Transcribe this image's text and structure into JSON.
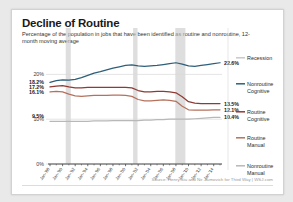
{
  "title": "Decline of Routine",
  "subtitle": "Percentage of the population in jobs that have been identified as routine and nonroutine, 12-month moving average",
  "source": "Source: Henry Siu and Nir Jaimovich for Third Way  |  WSJ.com",
  "colors": {
    "nonroutine_cognitive": "#2e5f7a",
    "routine_cognitive": "#8e3b34",
    "routine_manual": "#b5715c",
    "nonroutine_manual": "#b8b8b8",
    "recession": "#c9c9c9",
    "grid": "#d8d8d8",
    "axis": "#4a4a4a"
  },
  "legend": {
    "items": [
      {
        "label_line1": "Recession",
        "label_line2": "",
        "color": "#c9c9c9"
      },
      {
        "label_line1": "Nonroutine",
        "label_line2": "Cognitive",
        "color": "#2e5f7a"
      },
      {
        "label_line1": "Routine",
        "label_line2": "Cognitive",
        "color": "#8e3b34"
      },
      {
        "label_line1": "Routine",
        "label_line2": "Manual",
        "color": "#b5715c"
      },
      {
        "label_line1": "Nonroutine",
        "label_line2": "Manual",
        "color": "#b8b8b8"
      }
    ]
  },
  "chart_data": {
    "type": "line",
    "title": "Decline of Routine",
    "subtitle": "Percentage of the population in jobs that have been identified as routine and nonroutine, 12-month moving average",
    "xlabel": "",
    "ylabel": "",
    "ylim": [
      0,
      25
    ],
    "yticks": [
      0,
      10,
      20
    ],
    "ytick_labels": [
      "0%",
      "10%",
      "20%"
    ],
    "grid": true,
    "legend_position": "right",
    "x_tick_labels": [
      "Jan-'88",
      "Jan-'90",
      "Jan-'92",
      "Jan-'94",
      "Jan-'96",
      "Jan-'98",
      "Jan-'00",
      "Jan-'02",
      "Jan-'04",
      "Jan-'06",
      "Jan-'08",
      "Jan-'10",
      "Jan-'12",
      "Jan-'14"
    ],
    "x_start_year": 1988,
    "x_end_year": 2015,
    "start_labels": [
      {
        "series": "Nonroutine Cognitive",
        "value": "18.2%"
      },
      {
        "series": "Routine Cognitive",
        "value": "17.2%"
      },
      {
        "series": "Routine Manual",
        "value": "16.1%"
      },
      {
        "series": "Nonroutine Manual",
        "value": "9.5%"
      }
    ],
    "end_labels": [
      {
        "series": "Nonroutine Cognitive",
        "value": "22.6%"
      },
      {
        "series": "Routine Cognitive",
        "value": "13.5%"
      },
      {
        "series": "Routine Manual",
        "value": "12.1%"
      },
      {
        "series": "Nonroutine Manual",
        "value": "10.4%"
      }
    ],
    "recessions": [
      {
        "start": 1990.5,
        "end": 1991.3
      },
      {
        "start": 2001.2,
        "end": 2001.9
      },
      {
        "start": 2007.9,
        "end": 2009.5
      }
    ],
    "x": [
      1988,
      1989,
      1990,
      1991,
      1992,
      1993,
      1994,
      1995,
      1996,
      1997,
      1998,
      1999,
      2000,
      2001,
      2002,
      2003,
      2004,
      2005,
      2006,
      2007,
      2008,
      2009,
      2010,
      2011,
      2012,
      2013,
      2014,
      2015
    ],
    "series": [
      {
        "name": "Nonroutine Cognitive",
        "color": "#2e5f7a",
        "values": [
          18.2,
          18.6,
          18.8,
          18.7,
          18.9,
          19.3,
          19.8,
          20.3,
          20.6,
          21.0,
          21.4,
          21.7,
          22.0,
          22.1,
          21.9,
          21.8,
          21.9,
          22.0,
          22.2,
          22.4,
          22.6,
          22.3,
          21.9,
          21.8,
          22.0,
          22.2,
          22.4,
          22.6
        ]
      },
      {
        "name": "Routine Cognitive",
        "color": "#8e3b34",
        "values": [
          17.2,
          17.4,
          17.5,
          17.2,
          17.0,
          17.0,
          17.1,
          17.1,
          17.1,
          17.1,
          17.1,
          17.1,
          17.1,
          17.0,
          16.4,
          16.1,
          16.1,
          16.2,
          16.2,
          16.1,
          15.9,
          15.0,
          13.9,
          13.6,
          13.5,
          13.5,
          13.5,
          13.5
        ]
      },
      {
        "name": "Routine Manual",
        "color": "#b5715c",
        "values": [
          16.1,
          16.2,
          16.1,
          15.6,
          15.2,
          15.1,
          15.2,
          15.3,
          15.3,
          15.3,
          15.4,
          15.4,
          15.3,
          15.1,
          14.4,
          14.1,
          14.1,
          14.2,
          14.3,
          14.2,
          14.0,
          12.9,
          12.1,
          12.0,
          12.0,
          12.0,
          12.1,
          12.1
        ]
      },
      {
        "name": "Nonroutine Manual",
        "color": "#b8b8b8",
        "values": [
          9.5,
          9.5,
          9.5,
          9.5,
          9.5,
          9.5,
          9.5,
          9.6,
          9.6,
          9.6,
          9.7,
          9.7,
          9.7,
          9.7,
          9.7,
          9.8,
          9.8,
          9.9,
          9.9,
          10.0,
          10.0,
          10.0,
          10.0,
          10.1,
          10.2,
          10.3,
          10.4,
          10.4
        ]
      }
    ]
  }
}
